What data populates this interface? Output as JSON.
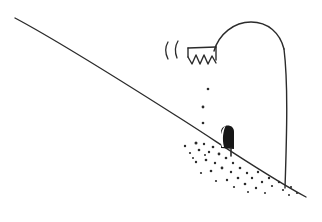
{
  "canvas": {
    "width": 322,
    "height": 222,
    "background_color": "#ffffff",
    "ink_color": "#2b2b2b",
    "fill_color": "#171717",
    "highlight_color": "#ffffff",
    "medium": "pen-and-ink line drawing",
    "title": "hand-drawn sketch of a hillside slope with a dark burrow opening"
  },
  "elements": {
    "ground_slope": {
      "name": "ground-slope-line",
      "description": "long diagonal hillside line descending from upper left to lower right",
      "stroke_width": 1.4,
      "path": "M 15 18 C 60 42, 120 80, 175 115 C 215 140, 260 172, 306 197"
    },
    "hill_dome": {
      "name": "hill-dome-curve",
      "description": "rounded dome arc rising above the slope at right of center",
      "stroke_width": 1.4,
      "path": "M 214 51 C 219 34, 234 22, 251 22 C 268 22, 280 33, 284 49"
    },
    "dome_right_flank": {
      "name": "dome-right-flank-curve",
      "description": "long nearly vertical curve descending from the dome down to the slope line",
      "stroke_width": 1.4,
      "path": "M 284 49 C 288 82, 287 128, 285 188"
    },
    "ledge_bar": {
      "name": "ledge-horizontal-bar",
      "description": "short horizontal bar forming the top of the jagged structure",
      "stroke_width": 1.4,
      "path": "M 188 48 L 216 47"
    },
    "ledge_left_edge": {
      "name": "ledge-left-edge",
      "description": "short vertical tick closing the left end of the ledge bar",
      "stroke_width": 1.4,
      "path": "M 188 48 L 188 57"
    },
    "ledge_right_edge": {
      "name": "ledge-right-edge",
      "description": "short vertical tick closing the right end of the ledge bar",
      "stroke_width": 1.4,
      "path": "M 216 47 L 216 60"
    },
    "zigzag_teeth": {
      "name": "zigzag-teeth",
      "description": "row of four jagged sawtooth points hanging under the ledge bar",
      "tooth_count": 4,
      "stroke_width": 1.4,
      "path": "M 188 57 L 192 64 L 196 55 L 200 64 L 204 55 L 208 64 L 212 56 L 216 63"
    },
    "paren_mark_left": {
      "name": "paren-mark-left",
      "description": "small curved parenthesis-like stroke left of the ledge",
      "stroke_width": 1.3,
      "path": "M 168 42 C 165 47, 165 53, 168 59"
    },
    "paren_mark_right": {
      "name": "paren-mark-right",
      "description": "second small curved parenthesis-like stroke beside the first",
      "stroke_width": 1.3,
      "path": "M 178 41 C 175 46, 175 53, 177 58"
    },
    "burrow": {
      "name": "burrow-opening",
      "description": "solid black arched opening set into the slope",
      "body_path": "M 221 148 L 221 132 C 221 124, 234 123, 234 132 L 234 149 Z",
      "highlight_path": "M 222 147 C 219 139, 221 129, 226 125 C 223 131, 222 139, 224 147 Z",
      "stem_path": "M 231 148 L 231 156"
    },
    "trail_dots": {
      "name": "descending-trail-dots",
      "description": "three small dots forming a trail from the ledge down toward the burrow",
      "dots": [
        {
          "cx": 208,
          "cy": 89,
          "r": 1.3
        },
        {
          "cx": 203,
          "cy": 107,
          "r": 1.4
        },
        {
          "cx": 203,
          "cy": 123,
          "r": 1.3
        }
      ]
    },
    "stipple_field": {
      "name": "stipple-dot-field",
      "description": "scattered stippling of small dots spilling down the slope from the burrow",
      "dots": [
        {
          "cx": 185,
          "cy": 146,
          "r": 1.2
        },
        {
          "cx": 196,
          "cy": 143,
          "r": 1.5
        },
        {
          "cx": 204,
          "cy": 144,
          "r": 1.2
        },
        {
          "cx": 199,
          "cy": 150,
          "r": 1.3
        },
        {
          "cx": 190,
          "cy": 153,
          "r": 1.1
        },
        {
          "cx": 209,
          "cy": 152,
          "r": 1.2
        },
        {
          "cx": 213,
          "cy": 147,
          "r": 1.3
        },
        {
          "cx": 219,
          "cy": 154,
          "r": 1.4
        },
        {
          "cx": 206,
          "cy": 160,
          "r": 1.3
        },
        {
          "cx": 196,
          "cy": 162,
          "r": 1.2
        },
        {
          "cx": 215,
          "cy": 163,
          "r": 1.2
        },
        {
          "cx": 226,
          "cy": 158,
          "r": 1.3
        },
        {
          "cx": 233,
          "cy": 163,
          "r": 1.2
        },
        {
          "cx": 222,
          "cy": 168,
          "r": 1.4
        },
        {
          "cx": 211,
          "cy": 171,
          "r": 1.3
        },
        {
          "cx": 201,
          "cy": 173,
          "r": 1.1
        },
        {
          "cx": 231,
          "cy": 172,
          "r": 1.2
        },
        {
          "cx": 240,
          "cy": 168,
          "r": 1.3
        },
        {
          "cx": 247,
          "cy": 173,
          "r": 1.2
        },
        {
          "cx": 238,
          "cy": 178,
          "r": 1.3
        },
        {
          "cx": 227,
          "cy": 180,
          "r": 1.2
        },
        {
          "cx": 216,
          "cy": 181,
          "r": 1.1
        },
        {
          "cx": 252,
          "cy": 178,
          "r": 1.2
        },
        {
          "cx": 258,
          "cy": 172,
          "r": 1.2
        },
        {
          "cx": 245,
          "cy": 184,
          "r": 1.3
        },
        {
          "cx": 234,
          "cy": 187,
          "r": 1.1
        },
        {
          "cx": 262,
          "cy": 182,
          "r": 1.2
        },
        {
          "cx": 269,
          "cy": 178,
          "r": 1.2
        },
        {
          "cx": 256,
          "cy": 188,
          "r": 1.2
        },
        {
          "cx": 272,
          "cy": 186,
          "r": 1.1
        },
        {
          "cx": 279,
          "cy": 182,
          "r": 1.2
        },
        {
          "cx": 283,
          "cy": 190,
          "r": 1.1
        },
        {
          "cx": 291,
          "cy": 187,
          "r": 1.1
        },
        {
          "cx": 297,
          "cy": 193,
          "r": 1.1
        },
        {
          "cx": 289,
          "cy": 195,
          "r": 1.0
        },
        {
          "cx": 265,
          "cy": 193,
          "r": 1.0
        },
        {
          "cx": 248,
          "cy": 192,
          "r": 1.0
        },
        {
          "cx": 205,
          "cy": 155,
          "r": 1.0
        },
        {
          "cx": 193,
          "cy": 158,
          "r": 1.0
        }
      ]
    }
  }
}
